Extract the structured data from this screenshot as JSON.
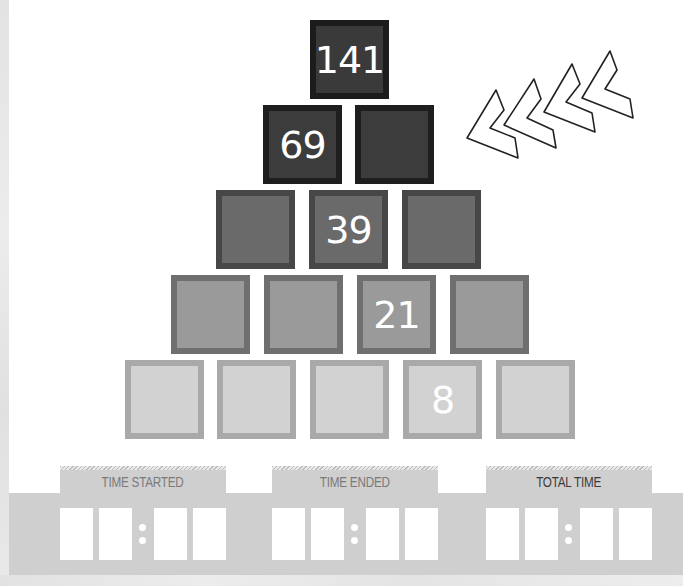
{
  "puzzle": {
    "type": "number-pyramid",
    "rows": [
      {
        "cells": [
          "141"
        ]
      },
      {
        "cells": [
          "69",
          ""
        ]
      },
      {
        "cells": [
          "",
          "39",
          ""
        ]
      },
      {
        "cells": [
          "",
          "",
          "21",
          ""
        ]
      },
      {
        "cells": [
          "",
          "",
          "",
          "8",
          ""
        ]
      }
    ],
    "row_colors": {
      "row1": "#3a3a3a",
      "row2": "#3c3c3c",
      "row3": "#6a6a6a",
      "row4": "#9a9a9a",
      "row5": "#d2d2d2"
    },
    "decoration": "chevron-arrows-icon"
  },
  "timers": [
    {
      "label": "TIME STARTED",
      "digits": [
        "",
        "",
        "",
        ""
      ]
    },
    {
      "label": "TIME ENDED",
      "digits": [
        "",
        "",
        "",
        ""
      ]
    },
    {
      "label": "TOTAL TIME",
      "digits": [
        "",
        "",
        "",
        ""
      ]
    }
  ]
}
